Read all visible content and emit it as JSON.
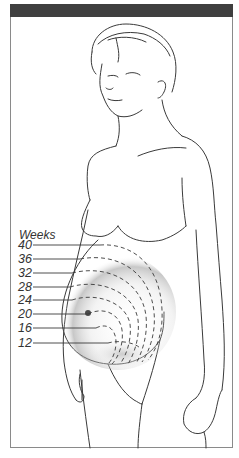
{
  "figure": {
    "header_bar_color": "#3f3f3f",
    "border_color": "#8a8a8a",
    "line_color": "#333333"
  },
  "legend": {
    "title": "Weeks",
    "labels": [
      {
        "week": "40",
        "y": 245,
        "line_end_x": 100
      },
      {
        "week": "36",
        "y": 259,
        "line_end_x": 80
      },
      {
        "week": "32",
        "y": 273,
        "line_end_x": 72
      },
      {
        "week": "28",
        "y": 287,
        "line_end_x": 70
      },
      {
        "week": "24",
        "y": 300,
        "line_end_x": 72
      },
      {
        "week": "20",
        "y": 314,
        "line_end_x": 88
      },
      {
        "week": "16",
        "y": 328,
        "line_end_x": 96
      },
      {
        "week": "12",
        "y": 343,
        "line_end_x": 108
      }
    ]
  }
}
